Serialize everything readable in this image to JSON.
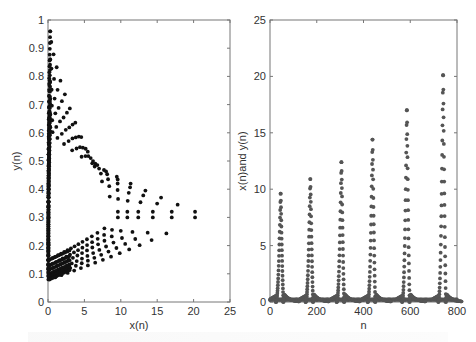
{
  "chart_data": [
    {
      "type": "scatter",
      "title": "",
      "xlabel": "x(n)",
      "ylabel": "y(n)",
      "xlim": [
        0,
        25
      ],
      "ylim": [
        0,
        1
      ],
      "xticks": [
        0,
        5,
        10,
        15,
        20,
        25
      ],
      "yticks": [
        0,
        0.1,
        0.2,
        0.3,
        0.4,
        0.5,
        0.6,
        0.7,
        0.8,
        0.9,
        1
      ],
      "grid": false,
      "marker_color": "#111111",
      "description": "Phase-plane orbit: nested loops of x(n) vs y(n)",
      "series": [
        {
          "name": "loop-1",
          "x_max": 9.6,
          "y_max": 0.96,
          "y_min": 0.15
        },
        {
          "name": "loop-2",
          "x_max": 10.9,
          "y_max": 0.86,
          "y_min": 0.13
        },
        {
          "name": "loop-3",
          "x_max": 12.4,
          "y_max": 0.78,
          "y_min": 0.115
        },
        {
          "name": "loop-4",
          "x_max": 14.4,
          "y_max": 0.72,
          "y_min": 0.1
        },
        {
          "name": "loop-5",
          "x_max": 17.0,
          "y_max": 0.665,
          "y_min": 0.09
        },
        {
          "name": "loop-6",
          "x_max": 20.2,
          "y_max": 0.62,
          "y_min": 0.08
        }
      ]
    },
    {
      "type": "scatter",
      "title": "",
      "xlabel": "n",
      "ylabel": "x(n)and y(n)",
      "xlim": [
        0,
        800
      ],
      "ylim": [
        0,
        25
      ],
      "xticks": [
        0,
        200,
        400,
        600,
        800
      ],
      "yticks": [
        0,
        5,
        10,
        15,
        20,
        25
      ],
      "grid": false,
      "marker_color": "#555555",
      "description": "Time series of x(n) and y(n) with growing periodic spikes",
      "peaks": [
        {
          "n": 45,
          "value": 9.6
        },
        {
          "n": 172,
          "value": 10.9
        },
        {
          "n": 305,
          "value": 12.4
        },
        {
          "n": 438,
          "value": 14.4
        },
        {
          "n": 585,
          "value": 17.0
        },
        {
          "n": 740,
          "value": 20.1
        }
      ]
    }
  ]
}
